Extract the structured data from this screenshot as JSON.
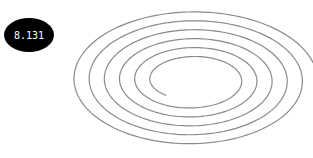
{
  "badge": {
    "value": "8.131",
    "bg": "#000000",
    "fg": "#ffffff"
  },
  "spiral": {
    "icon": "spiral-icon",
    "stroke": "#8a8a8a",
    "center_x": 192,
    "center_y": 80,
    "inner_rx": 40,
    "inner_ry": 20,
    "outer_rx": 125,
    "outer_ry": 70,
    "turns": 5.6,
    "start_angle_deg": 130
  }
}
